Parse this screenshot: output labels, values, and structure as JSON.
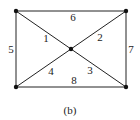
{
  "diagram": {
    "caption": "(b)",
    "nodes": [
      {
        "id": "tl",
        "x": 16,
        "y": 11
      },
      {
        "id": "tr",
        "x": 126,
        "y": 11
      },
      {
        "id": "bl",
        "x": 16,
        "y": 87
      },
      {
        "id": "br",
        "x": 126,
        "y": 87
      },
      {
        "id": "c",
        "x": 71,
        "y": 49
      }
    ],
    "edges": [
      {
        "label": "1",
        "from": "tl",
        "to": "c",
        "lx": 46,
        "ly": 38
      },
      {
        "label": "2",
        "from": "tr",
        "to": "c",
        "lx": 100,
        "ly": 37
      },
      {
        "label": "3",
        "from": "c",
        "to": "br",
        "lx": 90,
        "ly": 70
      },
      {
        "label": "4",
        "from": "bl",
        "to": "c",
        "lx": 51,
        "ly": 71
      },
      {
        "label": "5",
        "from": "tl",
        "to": "bl",
        "lx": 10,
        "ly": 49
      },
      {
        "label": "6",
        "from": "tl",
        "to": "tr",
        "lx": 73,
        "ly": 17
      },
      {
        "label": "7",
        "from": "tr",
        "to": "br",
        "lx": 131,
        "ly": 49
      },
      {
        "label": "8",
        "from": "bl",
        "to": "br",
        "lx": 74,
        "ly": 80
      }
    ]
  }
}
